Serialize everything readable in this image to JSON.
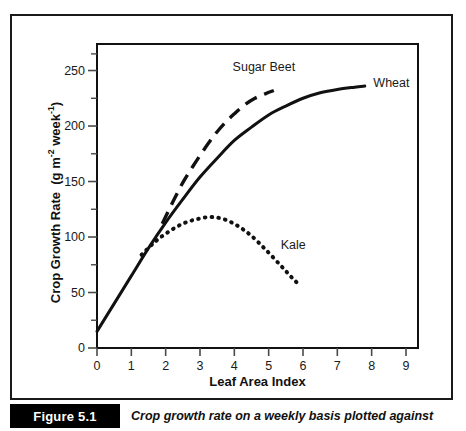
{
  "figure": {
    "tag": "Figure 5.1",
    "caption": "Crop growth rate on a weekly basis plotted against"
  },
  "chart_data": {
    "type": "line",
    "title": "",
    "xlabel": "Leaf Area Index",
    "ylabel_main": "Crop Growth Rate",
    "ylabel_units": "(g m",
    "ylabel_units_exp1": "-2",
    "ylabel_units_mid": " week",
    "ylabel_units_exp2": "-1",
    "ylabel_units_end": ")",
    "ylabel_plain": "Crop Growth Rate (g m-2 week-1)",
    "xlim": [
      0,
      9.35
    ],
    "ylim": [
      0,
      273
    ],
    "xticks": [
      0,
      1,
      2,
      3,
      4,
      5,
      6,
      7,
      8,
      9
    ],
    "xtick_labels": [
      "0",
      "1",
      "2",
      "3",
      "4",
      "5",
      "6",
      "7",
      "8",
      "9"
    ],
    "yticks": [
      0,
      50,
      100,
      150,
      200,
      250
    ],
    "ytick_labels": [
      "0",
      "50",
      "100",
      "150",
      "200",
      "250"
    ],
    "yticks_minor": [
      25,
      75,
      125,
      175,
      225,
      265
    ],
    "grid": false,
    "legend_position": "inline-annotations",
    "series": [
      {
        "name": "Wheat",
        "style": "solid",
        "color": "#111111",
        "label_x": 8.05,
        "label_y": 238,
        "x": [
          0.0,
          0.5,
          1.0,
          1.5,
          2.0,
          2.5,
          3.0,
          3.5,
          4.0,
          4.5,
          5.0,
          5.5,
          6.0,
          6.5,
          7.0,
          7.5,
          7.8
        ],
        "y": [
          15,
          40,
          65,
          90,
          113,
          134,
          154,
          171,
          187,
          199,
          210,
          218,
          225,
          230,
          233,
          235,
          236
        ]
      },
      {
        "name": "Sugar Beet",
        "style": "dashed",
        "color": "#111111",
        "label_x": 3.95,
        "label_y": 252,
        "x": [
          1.9,
          2.2,
          2.5,
          2.8,
          3.1,
          3.4,
          3.7,
          4.0,
          4.3,
          4.6,
          4.9,
          5.15
        ],
        "y": [
          112,
          131,
          149,
          164,
          178,
          191,
          202,
          211,
          219,
          225,
          229,
          232
        ]
      },
      {
        "name": "Kale",
        "style": "dotted",
        "color": "#111111",
        "label_x": 5.35,
        "label_y": 92,
        "x": [
          1.3,
          1.7,
          2.1,
          2.5,
          2.9,
          3.3,
          3.7,
          4.1,
          4.5,
          4.9,
          5.3,
          5.6,
          5.85
        ],
        "y": [
          84,
          96,
          105,
          112,
          116,
          118,
          116,
          110,
          101,
          89,
          76,
          66,
          58
        ]
      }
    ]
  }
}
